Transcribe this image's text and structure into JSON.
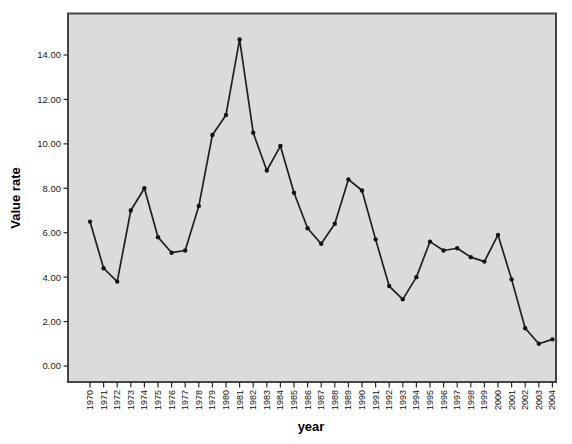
{
  "figure": {
    "background": "#ffffff",
    "plot_bg": "#dbdbdb",
    "border_color": "#454545",
    "tick_color": "#2a2a2a",
    "line_color": "#1f1f1f",
    "marker_color": "#141414",
    "stray_mark": "'"
  },
  "chart_data": {
    "type": "line",
    "title": "",
    "xlabel": "year",
    "ylabel": "Value rate",
    "categories": [
      "1970",
      "1971",
      "1972",
      "1973",
      "1974",
      "1975",
      "1976",
      "1977",
      "1978",
      "1979",
      "1980",
      "1981",
      "1982",
      "1983",
      "1984",
      "1985",
      "1986",
      "1987",
      "1988",
      "1989",
      "1990",
      "1991",
      "1992",
      "1993",
      "1994",
      "1995",
      "1996",
      "1997",
      "1998",
      "1999",
      "2000",
      "2001",
      "2002",
      "2003",
      "2004"
    ],
    "values": [
      6.5,
      4.4,
      3.8,
      7.0,
      8.0,
      5.8,
      5.1,
      5.2,
      7.2,
      10.4,
      11.3,
      14.7,
      10.5,
      8.8,
      9.9,
      7.8,
      6.2,
      5.5,
      6.4,
      8.4,
      7.9,
      5.7,
      3.6,
      3.0,
      4.0,
      5.6,
      5.2,
      5.3,
      4.9,
      4.7,
      5.9,
      3.9,
      1.7,
      1.0,
      1.2
    ],
    "yticks": [
      0,
      2,
      4,
      6,
      8,
      10,
      12,
      14
    ],
    "ytick_labels": [
      "0.00",
      "2.00",
      "4.00",
      "6.00",
      "8.00",
      "10.00",
      "12.00",
      "14.00"
    ],
    "ylim": [
      -0.7,
      15.9
    ],
    "grid": false,
    "legend": null,
    "marker": "circle"
  }
}
